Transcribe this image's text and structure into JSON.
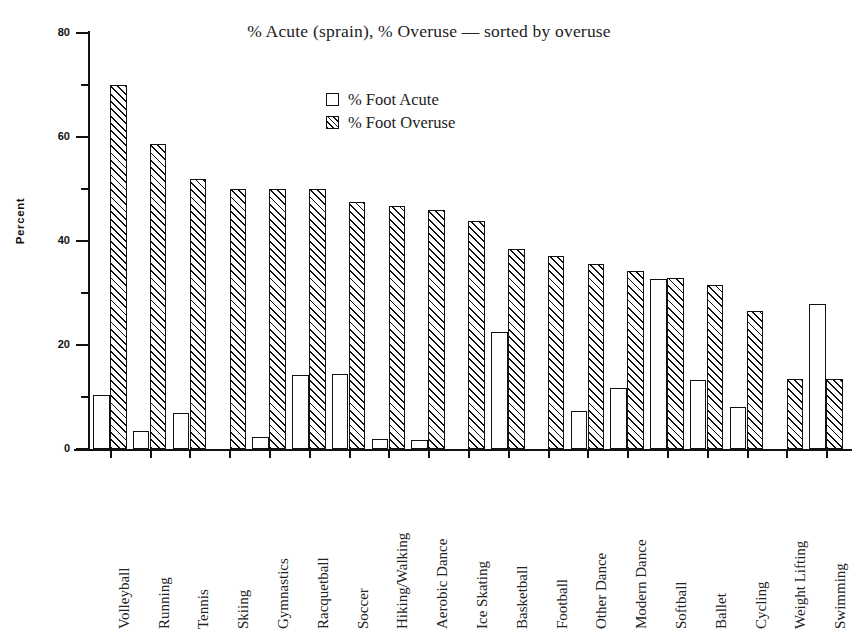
{
  "chart_data": {
    "type": "bar",
    "title": "% Acute (sprain), % Overuse — sorted by overuse",
    "xlabel": "",
    "ylabel": "Percent",
    "ylim": [
      0,
      80
    ],
    "y_ticks_major": [
      0,
      20,
      40,
      60,
      80
    ],
    "y_ticks_minor": [
      10,
      30,
      50,
      70
    ],
    "grid": false,
    "legend_position": "upper-center",
    "categories": [
      "Volleyball",
      "Running",
      "Tennis",
      "Skiing",
      "Gymnastics",
      "Racquetball",
      "Soccer",
      "Hiking/Walking",
      "Aerobic Dance",
      "Ice Skating",
      "Basketball",
      "Football",
      "Other Dance",
      "Modern Dance",
      "Softball",
      "Ballet",
      "Cycling",
      "Weight Lifting",
      "Swimming"
    ],
    "series": [
      {
        "name": "% Foot Acute",
        "values": [
          10.3,
          3.5,
          7.0,
          0,
          2.4,
          14.2,
          14.5,
          2.0,
          1.7,
          0,
          22.5,
          0,
          7.4,
          11.8,
          32.7,
          13.3,
          8.1,
          0,
          27.8
        ]
      },
      {
        "name": "% Foot Overuse",
        "values": [
          70.0,
          58.7,
          52.0,
          50.0,
          50.0,
          50.0,
          47.5,
          46.8,
          46.0,
          43.8,
          38.5,
          37.2,
          35.5,
          34.2,
          32.9,
          31.6,
          26.5,
          13.5,
          13.5
        ]
      }
    ]
  },
  "legend": {
    "items": [
      {
        "label": "% Foot Acute",
        "swatch": "empty-square"
      },
      {
        "label": "% Foot Overuse",
        "swatch": "hatched-square"
      }
    ]
  },
  "colors": {
    "ink": "#111111",
    "background": "#ffffff"
  }
}
